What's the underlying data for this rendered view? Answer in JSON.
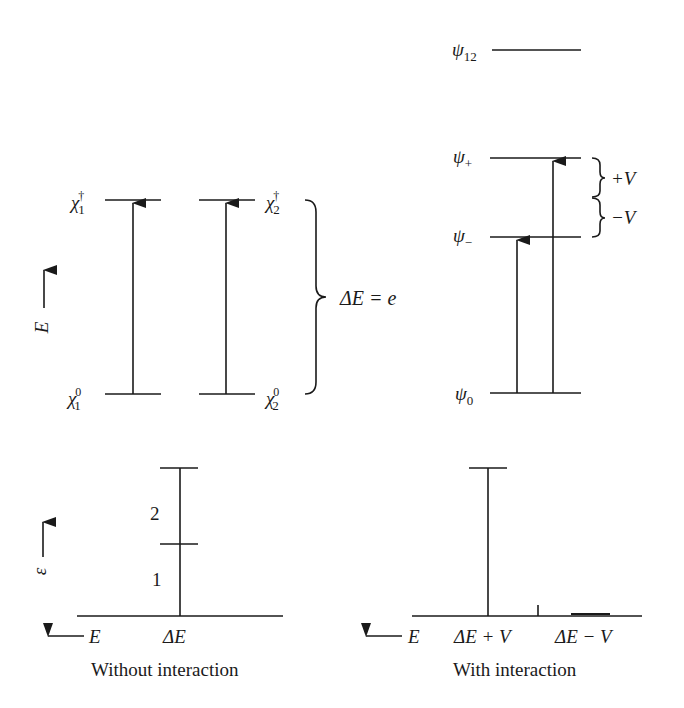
{
  "diagram": {
    "left_panel": {
      "levels": [
        {
          "id": "chi1_dagger",
          "symbol": "χ",
          "sub": "1",
          "sup": "†"
        },
        {
          "id": "chi2_dagger",
          "symbol": "χ",
          "sub": "2",
          "sup": "†"
        },
        {
          "id": "chi1_0",
          "symbol": "χ",
          "sub": "1",
          "sup": "0"
        },
        {
          "id": "chi2_0",
          "symbol": "χ",
          "sub": "2",
          "sup": "0"
        }
      ],
      "axis_label": "E",
      "brace_label": "ΔE = e"
    },
    "right_panel": {
      "levels": [
        {
          "id": "psi12",
          "symbol": "ψ",
          "sub": "12"
        },
        {
          "id": "psi_plus",
          "symbol": "ψ",
          "sub": "+"
        },
        {
          "id": "psi_minus",
          "symbol": "ψ",
          "sub": "−"
        },
        {
          "id": "psi0",
          "symbol": "ψ",
          "sub": "0"
        }
      ],
      "plus_v": "+V",
      "minus_v": "−V"
    },
    "spectrum_left": {
      "y_axis_label": "ε",
      "x_axis_label": "E",
      "peak_label": "ΔE",
      "segment_labels": [
        "2",
        "1"
      ],
      "caption": "Without interaction"
    },
    "spectrum_right": {
      "x_axis_label": "E",
      "peak_labels": [
        "ΔE + V",
        "ΔE − V"
      ],
      "caption": "With interaction"
    }
  }
}
